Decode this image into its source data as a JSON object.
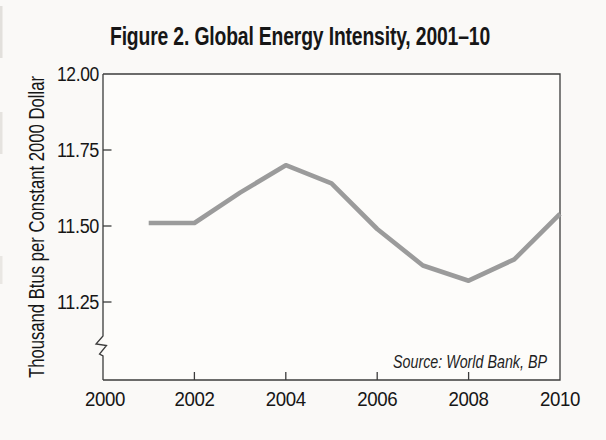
{
  "figure": {
    "title": "Figure 2. Global Energy Intensity, 2001–10",
    "source_note": "Source: World Bank, BP",
    "background_color": "#faf9f7",
    "plot_background_color": "#fdfcfa",
    "text_color": "#161616",
    "axis_color": "#3c3c3c",
    "line_color": "#9b9b9b"
  },
  "chart_data": {
    "type": "line",
    "title": "Figure 2. Global Energy Intensity, 2001–10",
    "xlabel": "",
    "ylabel": "Thousand Btus per Constant 2000 Dollar",
    "x": [
      2001,
      2002,
      2003,
      2004,
      2005,
      2006,
      2007,
      2008,
      2009,
      2010
    ],
    "series": [
      {
        "name": "Global Energy Intensity",
        "values": [
          11.51,
          11.51,
          11.61,
          11.7,
          11.64,
          11.49,
          11.37,
          11.32,
          11.39,
          11.54
        ]
      }
    ],
    "xlim": [
      2000,
      2010
    ],
    "ylim": [
      11.25,
      12.0
    ],
    "x_ticks": [
      2000,
      2002,
      2004,
      2006,
      2008,
      2010
    ],
    "x_tick_labels": [
      "2000",
      "2002",
      "2004",
      "2006",
      "2008",
      "2010"
    ],
    "y_ticks": [
      12.0,
      11.75,
      11.5,
      11.25
    ],
    "y_tick_labels": [
      "12.00",
      "11.75",
      "11.50",
      "11.25"
    ],
    "y_axis_break": true,
    "grid": false,
    "legend_position": "none",
    "source": "Source: World Bank, BP"
  }
}
